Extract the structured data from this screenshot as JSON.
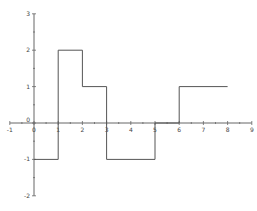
{
  "chart_data": {
    "type": "line",
    "subtype": "step",
    "title": "",
    "xlabel": "",
    "ylabel": "",
    "xlim": [
      -1,
      9
    ],
    "ylim": [
      -2,
      3
    ],
    "grid": false,
    "legend": null,
    "x_ticks": [
      "-1",
      "0",
      "1",
      "2",
      "3",
      "4",
      "5",
      "6",
      "7",
      "8",
      "9"
    ],
    "y_ticks": [
      "3",
      "2",
      "1",
      "0",
      "-1",
      "-2"
    ],
    "series": [
      {
        "name": "step",
        "color": "#555555",
        "points": [
          [
            0,
            -1
          ],
          [
            1,
            -1
          ],
          [
            1,
            2
          ],
          [
            2,
            2
          ],
          [
            2,
            1
          ],
          [
            3,
            1
          ],
          [
            3,
            -1
          ],
          [
            5,
            -1
          ],
          [
            5,
            0
          ],
          [
            6,
            0
          ],
          [
            6,
            1
          ],
          [
            8,
            1
          ]
        ]
      }
    ]
  }
}
